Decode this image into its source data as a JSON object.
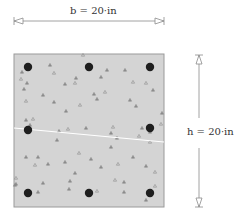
{
  "dimensions": {
    "width_label": "b = 20·in",
    "height_label": "h = 20·in"
  },
  "section": {
    "x": 14,
    "y": 54,
    "width": 150,
    "height": 153,
    "fill": "#d4d4d4",
    "stroke": "#9a9a9a"
  },
  "rebars": [
    {
      "cx": 28,
      "cy": 67
    },
    {
      "cx": 89,
      "cy": 67
    },
    {
      "cx": 150,
      "cy": 67
    },
    {
      "cx": 28,
      "cy": 130
    },
    {
      "cx": 150,
      "cy": 128
    },
    {
      "cx": 28,
      "cy": 193
    },
    {
      "cx": 89,
      "cy": 193
    },
    {
      "cx": 150,
      "cy": 193
    }
  ],
  "rebar_color": "#1e1e1e",
  "crack_line": {
    "x1": 14,
    "y1": 128,
    "x2": 164,
    "y2": 142,
    "color": "#ffffff"
  },
  "aggregate_color": "#8c8c8c",
  "aggregates": [
    [
      83,
      55
    ],
    [
      22,
      72
    ],
    [
      50,
      65
    ],
    [
      54,
      73
    ],
    [
      76,
      78
    ],
    [
      65,
      84
    ],
    [
      75,
      83
    ],
    [
      107,
      70
    ],
    [
      101,
      77
    ],
    [
      105,
      92
    ],
    [
      94,
      94
    ],
    [
      27,
      83
    ],
    [
      21,
      79
    ],
    [
      24,
      89
    ],
    [
      43,
      95
    ],
    [
      26,
      101
    ],
    [
      54,
      102
    ],
    [
      66,
      111
    ],
    [
      80,
      105
    ],
    [
      97,
      99
    ],
    [
      125,
      70
    ],
    [
      133,
      82
    ],
    [
      130,
      100
    ],
    [
      136,
      106
    ],
    [
      146,
      83
    ],
    [
      153,
      90
    ],
    [
      162,
      113
    ],
    [
      161,
      124
    ],
    [
      150,
      132
    ],
    [
      59,
      131
    ],
    [
      68,
      129
    ],
    [
      86,
      128
    ],
    [
      111,
      133
    ],
    [
      113,
      127
    ],
    [
      117,
      138
    ],
    [
      142,
      128
    ],
    [
      150,
      142
    ],
    [
      57,
      140
    ],
    [
      26,
      120
    ],
    [
      33,
      119
    ],
    [
      30,
      125
    ],
    [
      111,
      147
    ],
    [
      139,
      136
    ],
    [
      26,
      157
    ],
    [
      38,
      157
    ],
    [
      35,
      165
    ],
    [
      48,
      164
    ],
    [
      65,
      162
    ],
    [
      79,
      153
    ],
    [
      91,
      159
    ],
    [
      101,
      167
    ],
    [
      118,
      164
    ],
    [
      133,
      157
    ],
    [
      146,
      166
    ],
    [
      155,
      172
    ],
    [
      75,
      173
    ],
    [
      70,
      181
    ],
    [
      115,
      180
    ],
    [
      124,
      182
    ],
    [
      43,
      183
    ],
    [
      16,
      178
    ],
    [
      16,
      184
    ],
    [
      15,
      185
    ],
    [
      97,
      191
    ],
    [
      69,
      189
    ],
    [
      124,
      192
    ],
    [
      155,
      186
    ],
    [
      146,
      200
    ],
    [
      38,
      192
    ]
  ]
}
